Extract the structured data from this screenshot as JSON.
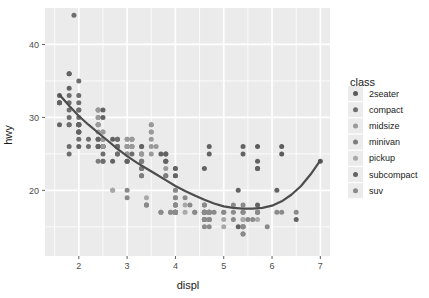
{
  "chart_data": {
    "type": "scatter",
    "title": "",
    "subtitle": "",
    "xlabel": "displ",
    "ylabel": "hwy",
    "xlim": [
      1.3,
      7.2
    ],
    "ylim": [
      11,
      45
    ],
    "xticks": [
      2,
      3,
      4,
      5,
      6,
      7
    ],
    "yticks": [
      20,
      30,
      40
    ],
    "xtick_labels": [
      "2",
      "3",
      "4",
      "5",
      "6",
      "7"
    ],
    "ytick_labels": [
      "20",
      "30",
      "40"
    ],
    "grid": true,
    "grid_minor": true,
    "panel_background": "#ebebeb",
    "grid_color": "#ffffff",
    "legend": {
      "title": "class",
      "position": "right",
      "entries": [
        {
          "label": "2seater",
          "color": "#5c5c5c"
        },
        {
          "label": "compact",
          "color": "#6e6e6e"
        },
        {
          "label": "midsize",
          "color": "#9a9a9a"
        },
        {
          "label": "minivan",
          "color": "#7c7c7c"
        },
        {
          "label": "pickup",
          "color": "#a8a8a8"
        },
        {
          "label": "subcompact",
          "color": "#636363"
        },
        {
          "label": "suv",
          "color": "#8a8a8a"
        }
      ]
    },
    "smooth": {
      "method": "loess",
      "color": "#4d4d4d",
      "width": 2.2,
      "points": [
        [
          1.6,
          33.1
        ],
        [
          1.8,
          31.6
        ],
        [
          2.0,
          30.2
        ],
        [
          2.2,
          29.0
        ],
        [
          2.4,
          27.9
        ],
        [
          2.6,
          26.8
        ],
        [
          2.8,
          25.7
        ],
        [
          3.0,
          24.7
        ],
        [
          3.2,
          23.8
        ],
        [
          3.4,
          23.0
        ],
        [
          3.6,
          22.2
        ],
        [
          3.8,
          21.4
        ],
        [
          4.0,
          20.6
        ],
        [
          4.2,
          19.9
        ],
        [
          4.4,
          19.3
        ],
        [
          4.6,
          18.7
        ],
        [
          4.8,
          18.2
        ],
        [
          5.0,
          17.8
        ],
        [
          5.2,
          17.6
        ],
        [
          5.4,
          17.5
        ],
        [
          5.6,
          17.5
        ],
        [
          5.8,
          17.6
        ],
        [
          6.0,
          17.9
        ],
        [
          6.2,
          18.5
        ],
        [
          6.4,
          19.4
        ],
        [
          6.6,
          20.6
        ],
        [
          6.8,
          22.2
        ],
        [
          7.0,
          24.1
        ]
      ]
    },
    "series": [
      {
        "name": "2seater",
        "color": "#5c5c5c",
        "points": [
          [
            5.7,
            26
          ],
          [
            5.7,
            23
          ],
          [
            6.2,
            26
          ],
          [
            6.2,
            25
          ],
          [
            7.0,
            24
          ]
        ]
      },
      {
        "name": "compact",
        "color": "#6e6e6e",
        "points": [
          [
            1.8,
            29
          ],
          [
            1.8,
            29
          ],
          [
            2.0,
            31
          ],
          [
            2.0,
            30
          ],
          [
            2.8,
            26
          ],
          [
            2.8,
            26
          ],
          [
            3.1,
            27
          ],
          [
            1.8,
            26
          ],
          [
            1.8,
            25
          ],
          [
            2.0,
            28
          ],
          [
            2.0,
            27
          ],
          [
            2.8,
            25
          ],
          [
            2.8,
            25
          ],
          [
            3.1,
            25
          ],
          [
            1.8,
            33
          ],
          [
            1.8,
            32
          ],
          [
            2.0,
            32
          ],
          [
            2.0,
            31
          ],
          [
            2.8,
            27
          ],
          [
            2.8,
            26
          ],
          [
            3.1,
            26
          ],
          [
            2.4,
            29
          ],
          [
            2.4,
            27
          ],
          [
            2.5,
            26
          ],
          [
            2.5,
            26
          ],
          [
            3.3,
            25
          ],
          [
            2.0,
            29
          ],
          [
            2.0,
            29
          ],
          [
            2.0,
            28
          ],
          [
            2.0,
            29
          ],
          [
            2.5,
            26
          ],
          [
            2.5,
            26
          ],
          [
            2.5,
            24
          ],
          [
            2.5,
            25
          ],
          [
            2.5,
            24
          ],
          [
            2.2,
            26
          ],
          [
            2.2,
            27
          ],
          [
            2.4,
            26
          ],
          [
            2.4,
            26
          ],
          [
            3.0,
            24
          ],
          [
            3.0,
            25
          ],
          [
            3.3,
            23
          ],
          [
            1.8,
            31
          ],
          [
            1.8,
            30
          ],
          [
            2.0,
            33
          ],
          [
            2.0,
            35
          ],
          [
            2.8,
            27
          ],
          [
            1.9,
            44
          ],
          [
            2.0,
            29
          ]
        ]
      },
      {
        "name": "midsize",
        "color": "#9a9a9a",
        "points": [
          [
            2.4,
            31
          ],
          [
            2.4,
            30
          ],
          [
            3.1,
            26
          ],
          [
            3.5,
            28
          ],
          [
            2.4,
            27
          ],
          [
            3.0,
            26
          ],
          [
            3.5,
            29
          ],
          [
            2.4,
            31
          ],
          [
            2.4,
            29
          ],
          [
            3.1,
            27
          ],
          [
            3.8,
            24
          ],
          [
            3.8,
            25
          ],
          [
            4.0,
            23
          ],
          [
            2.5,
            27
          ],
          [
            2.5,
            28
          ],
          [
            3.3,
            26
          ],
          [
            3.3,
            25
          ],
          [
            3.5,
            27
          ],
          [
            3.5,
            25
          ],
          [
            2.4,
            29
          ],
          [
            2.4,
            28
          ],
          [
            3.0,
            26
          ],
          [
            3.0,
            27
          ],
          [
            3.5,
            28
          ],
          [
            3.6,
            26
          ],
          [
            2.5,
            26
          ],
          [
            2.5,
            27
          ],
          [
            3.0,
            26
          ],
          [
            3.0,
            25
          ],
          [
            3.3,
            24
          ],
          [
            3.3,
            25
          ],
          [
            3.8,
            25
          ],
          [
            3.8,
            23
          ],
          [
            2.4,
            31
          ],
          [
            2.4,
            30
          ],
          [
            3.0,
            27
          ],
          [
            3.0,
            26
          ],
          [
            3.5,
            29
          ],
          [
            3.5,
            26
          ],
          [
            2.5,
            28
          ],
          [
            2.5,
            27
          ]
        ]
      },
      {
        "name": "minivan",
        "color": "#7c7c7c",
        "points": [
          [
            2.4,
            24
          ],
          [
            3.0,
            24
          ],
          [
            3.3,
            22
          ],
          [
            3.3,
            24
          ],
          [
            3.3,
            22
          ],
          [
            3.3,
            24
          ],
          [
            3.8,
            22
          ],
          [
            3.8,
            24
          ],
          [
            3.8,
            22
          ],
          [
            4.0,
            22
          ],
          [
            3.3,
            23
          ]
        ]
      },
      {
        "name": "pickup",
        "color": "#a8a8a8",
        "points": [
          [
            2.7,
            20
          ],
          [
            2.7,
            20
          ],
          [
            3.4,
            19
          ],
          [
            3.4,
            18
          ],
          [
            4.0,
            20
          ],
          [
            4.0,
            18
          ],
          [
            4.7,
            17
          ],
          [
            4.7,
            17
          ],
          [
            4.7,
            17
          ],
          [
            4.7,
            17
          ],
          [
            5.7,
            17
          ],
          [
            5.7,
            16
          ],
          [
            3.7,
            17
          ],
          [
            3.7,
            17
          ],
          [
            4.0,
            17
          ],
          [
            4.0,
            17
          ],
          [
            4.6,
            16
          ],
          [
            4.6,
            16
          ],
          [
            5.0,
            15
          ],
          [
            5.0,
            16
          ],
          [
            4.2,
            18
          ],
          [
            4.2,
            17
          ],
          [
            4.6,
            17
          ],
          [
            4.6,
            17
          ],
          [
            4.6,
            17
          ],
          [
            5.4,
            16
          ],
          [
            5.4,
            15
          ],
          [
            5.4,
            16
          ],
          [
            4.0,
            18
          ],
          [
            4.0,
            17
          ],
          [
            4.7,
            16
          ],
          [
            4.7,
            17
          ],
          [
            5.7,
            17
          ]
        ]
      },
      {
        "name": "subcompact",
        "color": "#636363",
        "points": [
          [
            1.6,
            33
          ],
          [
            1.6,
            32
          ],
          [
            1.6,
            32
          ],
          [
            1.6,
            29
          ],
          [
            1.6,
            32
          ],
          [
            1.8,
            34
          ],
          [
            1.8,
            36
          ],
          [
            1.8,
            36
          ],
          [
            2.0,
            29
          ],
          [
            2.4,
            26
          ],
          [
            2.4,
            27
          ],
          [
            2.5,
            30
          ],
          [
            2.5,
            31
          ],
          [
            3.3,
            26
          ],
          [
            2.0,
            28
          ],
          [
            2.0,
            26
          ],
          [
            2.0,
            29
          ],
          [
            2.0,
            28
          ],
          [
            2.7,
            27
          ],
          [
            2.7,
            24
          ],
          [
            3.0,
            24
          ],
          [
            3.7,
            25
          ],
          [
            4.0,
            23
          ],
          [
            4.7,
            26
          ],
          [
            4.7,
            25
          ],
          [
            5.7,
            24
          ],
          [
            5.7,
            23
          ],
          [
            6.1,
            20
          ],
          [
            4.0,
            17
          ],
          [
            4.0,
            22
          ],
          [
            4.6,
            23
          ],
          [
            5.4,
            26
          ],
          [
            5.4,
            25
          ],
          [
            3.8,
            24
          ],
          [
            3.8,
            25
          ],
          [
            5.3,
            20
          ],
          [
            5.3,
            15
          ],
          [
            5.7,
            18
          ],
          [
            6.5,
            16
          ]
        ]
      },
      {
        "name": "suv",
        "color": "#8a8a8a",
        "points": [
          [
            4.0,
            17
          ],
          [
            4.0,
            17
          ],
          [
            4.6,
            16
          ],
          [
            4.6,
            16
          ],
          [
            4.6,
            17
          ],
          [
            4.6,
            17
          ],
          [
            5.4,
            15
          ],
          [
            5.4,
            15
          ],
          [
            5.4,
            14
          ],
          [
            5.4,
            14
          ],
          [
            4.0,
            19
          ],
          [
            4.0,
            20
          ],
          [
            4.0,
            18
          ],
          [
            4.0,
            18
          ],
          [
            4.6,
            17
          ],
          [
            4.6,
            17
          ],
          [
            4.6,
            15
          ],
          [
            4.6,
            16
          ],
          [
            5.4,
            15
          ],
          [
            5.4,
            17
          ],
          [
            3.0,
            20
          ],
          [
            3.7,
            17
          ],
          [
            4.0,
            17
          ],
          [
            4.7,
            15
          ],
          [
            4.7,
            16
          ],
          [
            4.7,
            16
          ],
          [
            5.7,
            17
          ],
          [
            6.1,
            17
          ],
          [
            4.0,
            19
          ],
          [
            4.0,
            18
          ],
          [
            4.0,
            17
          ],
          [
            4.6,
            17
          ],
          [
            5.0,
            17
          ],
          [
            5.0,
            17
          ],
          [
            5.2,
            17
          ],
          [
            3.9,
            17
          ],
          [
            3.9,
            17
          ],
          [
            4.7,
            17
          ],
          [
            4.7,
            17
          ],
          [
            4.7,
            17
          ],
          [
            5.2,
            16
          ],
          [
            5.7,
            17
          ],
          [
            5.9,
            15
          ],
          [
            4.6,
            17
          ],
          [
            5.4,
            18
          ],
          [
            5.4,
            17
          ],
          [
            4.2,
            19
          ],
          [
            4.4,
            17
          ],
          [
            4.6,
            18
          ],
          [
            6.5,
            17
          ],
          [
            6.2,
            17
          ],
          [
            3.0,
            19
          ],
          [
            3.4,
            18
          ],
          [
            3.4,
            18
          ],
          [
            4.0,
            17
          ],
          [
            4.3,
            18
          ],
          [
            4.4,
            17
          ],
          [
            4.6,
            18
          ],
          [
            5.5,
            16
          ],
          [
            5.2,
            18
          ],
          [
            4.6,
            17
          ],
          [
            4.8,
            17
          ],
          [
            5.6,
            16
          ]
        ]
      }
    ]
  },
  "axes": {
    "x_title": "displ",
    "y_title": "hwy"
  }
}
